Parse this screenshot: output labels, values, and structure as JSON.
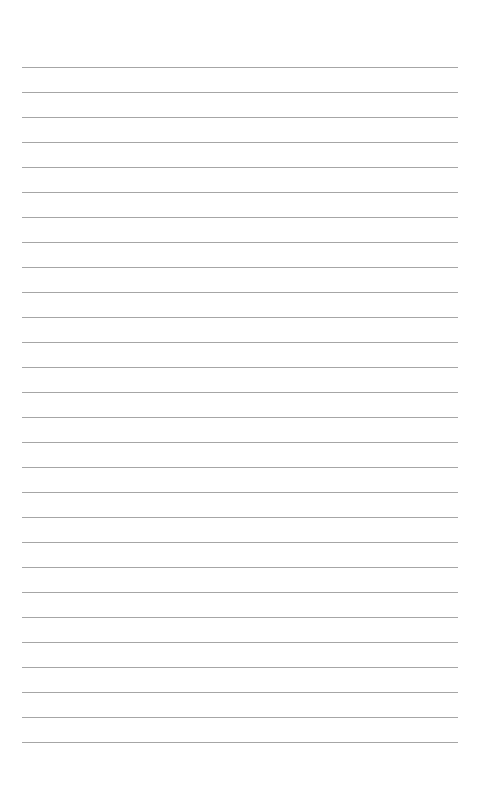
{
  "page": {
    "type": "lined-paper",
    "background_color": "#ffffff",
    "line_color": "#a6a6a6",
    "line_count": 28,
    "first_line_y": 67,
    "line_spacing": 25,
    "line_left": 22,
    "line_width": 436,
    "text": ""
  }
}
